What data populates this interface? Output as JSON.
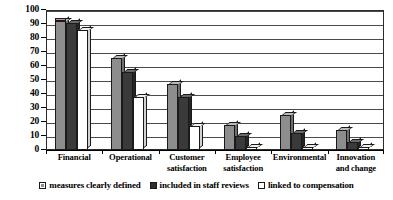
{
  "chart_data": {
    "type": "bar",
    "title": "",
    "subtitle": "",
    "xlabel": "",
    "ylabel": "",
    "ylim": [
      0,
      100
    ],
    "ytick_step": 10,
    "yticks": [
      100,
      90,
      80,
      70,
      60,
      50,
      40,
      30,
      20,
      10,
      0
    ],
    "grid": true,
    "legend_position": "bottom",
    "orientation": "vertical",
    "grouping": "clustered",
    "categories": [
      "Financial",
      "Operational",
      "Customer satisfaction",
      "Employee satisfaction",
      "Environmental",
      "Innovation and change"
    ],
    "category_lines": [
      [
        "Financial",
        ""
      ],
      [
        "Operational",
        ""
      ],
      [
        "Customer",
        "satisfaction"
      ],
      [
        "Employee",
        "satisfaction"
      ],
      [
        "Environmental",
        ""
      ],
      [
        "Innovation",
        "and change"
      ]
    ],
    "series": [
      {
        "name": "measures clearly defined",
        "color": "#8d8d8d",
        "values": [
          92,
          66,
          47,
          18,
          25,
          14
        ]
      },
      {
        "name": "included in staff reviews",
        "color": "#3a3a3a",
        "values": [
          91,
          56,
          38,
          10,
          12,
          6
        ]
      },
      {
        "name": "linked to compensation",
        "color": "#ffffff",
        "values": [
          86,
          38,
          17,
          2,
          2,
          2
        ]
      }
    ]
  },
  "legend": {
    "items": [
      {
        "label": "measures clearly defined",
        "swatch": "gray-square-swatch"
      },
      {
        "label": "included in staff reviews",
        "swatch": "dark-square-swatch"
      },
      {
        "label": "linked to compensation",
        "swatch": "white-square-swatch"
      }
    ]
  },
  "axes": {
    "y_tick_labels": [
      "100",
      "90",
      "80",
      "70",
      "60",
      "50",
      "40",
      "30",
      "20",
      "10",
      "0"
    ]
  }
}
